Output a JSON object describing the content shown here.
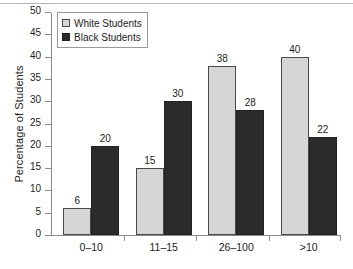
{
  "chart_data": {
    "type": "bar",
    "title": "",
    "xlabel": "",
    "ylabel": "Percentage of Students",
    "categories": [
      "0–10",
      "11–15",
      "26–100",
      ">10"
    ],
    "series": [
      {
        "name": "White Students",
        "color": "#d6d6d6",
        "values": [
          6,
          15,
          38,
          40
        ]
      },
      {
        "name": "Black Students",
        "color": "#2b2b2b",
        "values": [
          20,
          30,
          28,
          22
        ]
      }
    ],
    "ylim": [
      0,
      50
    ],
    "yticks": [
      0,
      5,
      10,
      15,
      20,
      25,
      30,
      35,
      40,
      45,
      50
    ],
    "ytick_labels": [
      "0",
      "5",
      "10",
      "15",
      "20",
      "25",
      "30",
      "35",
      "40",
      "45",
      "50"
    ],
    "grid": false,
    "legend_position": "top-left-inside",
    "data_labels": true
  }
}
